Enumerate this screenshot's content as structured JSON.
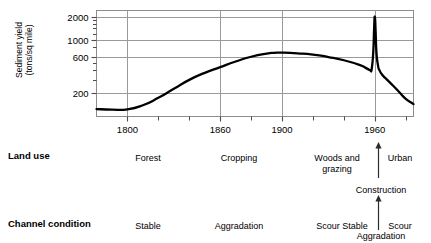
{
  "chart_data": {
    "type": "line",
    "title": "",
    "xlabel": "",
    "ylabel": "Sediment yield\n(tons/sq mile)",
    "yscale": "log",
    "ylim": [
      100,
      2400
    ],
    "xlim": [
      1780,
      1985
    ],
    "grid": true,
    "legend": false,
    "y_ticks": [
      200,
      600,
      1000,
      2000
    ],
    "y_tick_labels": [
      "200",
      "600",
      "1000",
      "2000"
    ],
    "y_minor_ticks": [
      300,
      400,
      500,
      800,
      1200,
      1400,
      1600,
      1800
    ],
    "x_ticks": [
      1800,
      1820,
      1840,
      1860,
      1880,
      1900,
      1920,
      1940,
      1960,
      1980
    ],
    "x_tick_labels_shown": [
      "1800",
      "1860",
      "1900",
      "1960"
    ],
    "x_gridlines": [
      1800,
      1860,
      1900,
      1960
    ],
    "series": [
      {
        "name": "Sediment yield",
        "x": [
          1780,
          1790,
          1800,
          1810,
          1820,
          1830,
          1840,
          1850,
          1860,
          1870,
          1880,
          1890,
          1895,
          1900,
          1910,
          1920,
          1930,
          1940,
          1950,
          1955,
          1957,
          1958,
          1959,
          1959.5,
          1960,
          1960.5,
          1961,
          1962,
          1963,
          1965,
          1968,
          1972,
          1976,
          1980,
          1985
        ],
        "y": [
          125,
          123,
          124,
          140,
          175,
          230,
          300,
          370,
          440,
          520,
          600,
          660,
          675,
          678,
          665,
          640,
          595,
          540,
          470,
          420,
          400,
          420,
          700,
          1350,
          2000,
          1300,
          700,
          470,
          400,
          345,
          300,
          250,
          205,
          170,
          145
        ]
      }
    ]
  },
  "rows": {
    "land_use": {
      "header": "Land use",
      "items": [
        {
          "label": "Forest",
          "x": 148,
          "y": 153,
          "lines": 1
        },
        {
          "label": "Cropping",
          "x": 239,
          "y": 153,
          "lines": 1
        },
        {
          "label": "Woods and\ngrazing",
          "x": 337,
          "y": 153,
          "lines": 2
        },
        {
          "label": "Urban",
          "x": 400,
          "y": 153,
          "lines": 1
        }
      ],
      "divider_arrow": {
        "x": 378,
        "top": 143,
        "bottom": 176,
        "direction": "up"
      }
    },
    "construction": {
      "label": "Construction",
      "x": 381,
      "y": 185
    },
    "channel_condition": {
      "header": "Channel condition",
      "items": [
        {
          "label": "Stable",
          "x": 148,
          "y": 221,
          "lines": 1
        },
        {
          "label": "Aggradation",
          "x": 239,
          "y": 221,
          "lines": 1
        },
        {
          "label": "Scour Stable",
          "x": 342,
          "y": 221,
          "lines": 1
        },
        {
          "label": "Scour",
          "x": 400,
          "y": 221,
          "lines": 1
        }
      ],
      "divider_arrow": {
        "x": 378,
        "top": 196,
        "bottom": 228,
        "direction": "up"
      }
    },
    "aggradation_bottom": {
      "label": "Aggradation",
      "x": 381,
      "y": 231
    }
  },
  "colors": {
    "curve": "#000000",
    "grid": "#9a9a9a",
    "axis": "#4d4d4d",
    "text": "#000000",
    "background": "#ffffff"
  }
}
